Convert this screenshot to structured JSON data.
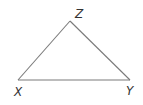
{
  "diagram": {
    "type": "triangle",
    "vertices": [
      {
        "id": "X",
        "label": "X"
      },
      {
        "id": "Y",
        "label": "Y"
      },
      {
        "id": "Z",
        "label": "Z"
      }
    ],
    "edges": [
      {
        "from": "X",
        "to": "Y"
      },
      {
        "from": "Y",
        "to": "Z"
      },
      {
        "from": "Z",
        "to": "X"
      }
    ],
    "colors": {
      "line": "#7a7a7a",
      "label": "#333333",
      "background": "#ffffff"
    }
  }
}
